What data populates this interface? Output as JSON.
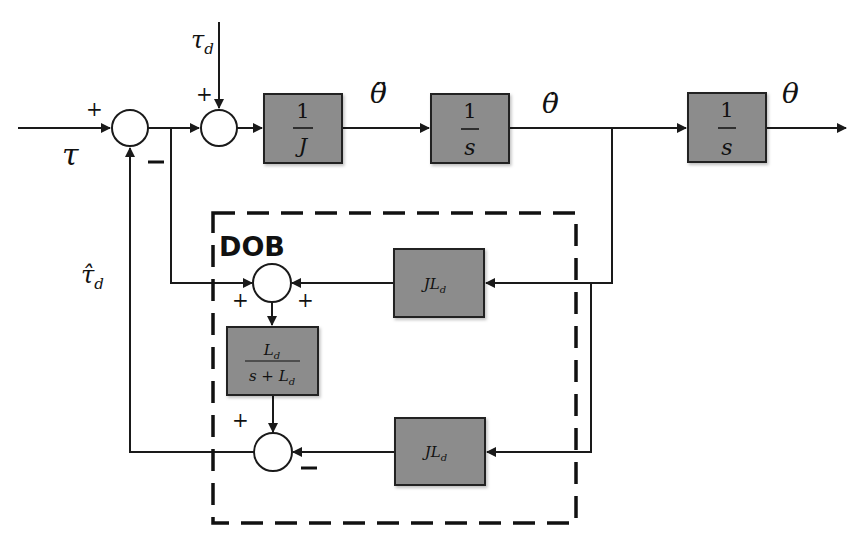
{
  "diagram": {
    "type": "control block diagram",
    "colors": {
      "block_fill": "#8c8c8c",
      "line": "#1a1a1a",
      "background": "#ffffff"
    },
    "signals": {
      "input": "τ",
      "disturbance": "τ",
      "disturbance_sub": "d",
      "estimate": "τ̂",
      "estimate_sub": "d",
      "accel": "θ̈",
      "velocity": "θ̇",
      "output": "θ"
    },
    "blocks": {
      "inertia": {
        "num": "1",
        "den": "J"
      },
      "integrator1": {
        "num": "1",
        "den": "s"
      },
      "integrator2": {
        "num": "1",
        "den": "s"
      },
      "jl_upper": {
        "main": "JL",
        "sub": "d"
      },
      "filter": {
        "num_main": "L",
        "num_sub": "d",
        "den_main": "s + L",
        "den_sub": "d"
      },
      "jl_lower": {
        "main": "JL",
        "sub": "d"
      }
    },
    "signs": {
      "sum1_in": "+",
      "sum1_fb": "−",
      "sum2_dist": "+",
      "sum3_left": "+",
      "sum3_right": "+",
      "sum4_top": "+",
      "sum4_right": "−"
    },
    "dob_label": "DOB"
  }
}
